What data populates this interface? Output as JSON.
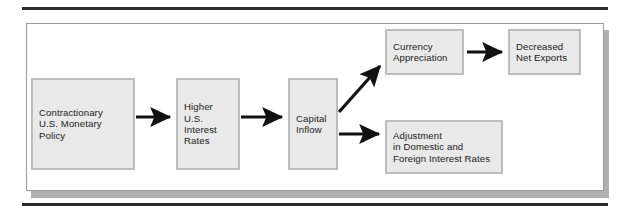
{
  "figure": {
    "title_rule_color": "#2b2b2b",
    "frame_border_color": "#9a9a9a",
    "node_fill_color": "#e9e9e9",
    "node_border_color": "#bdbdbd",
    "arrow_color": "#111111"
  },
  "diagram": {
    "type": "flowchart",
    "nodes": [
      {
        "id": "contractionary",
        "label": "Contractionary\nU.S. Monetary\nPolicy"
      },
      {
        "id": "higher",
        "label": "Higher\nU.S.\nInterest\nRates"
      },
      {
        "id": "capital",
        "label": "Capital\nInflow"
      },
      {
        "id": "currency",
        "label": "Currency\nAppreciation"
      },
      {
        "id": "decreased",
        "label": "Decreased\nNet Exports"
      },
      {
        "id": "adjustment",
        "label": "Adjustment\nin Domestic and\nForeign Interest Rates"
      }
    ],
    "edges": [
      {
        "from": "contractionary",
        "to": "higher",
        "style": "straight"
      },
      {
        "from": "higher",
        "to": "capital",
        "style": "straight"
      },
      {
        "from": "capital",
        "to": "currency",
        "style": "diagonal-up"
      },
      {
        "from": "capital",
        "to": "adjustment",
        "style": "straight"
      },
      {
        "from": "currency",
        "to": "decreased",
        "style": "straight"
      }
    ]
  }
}
